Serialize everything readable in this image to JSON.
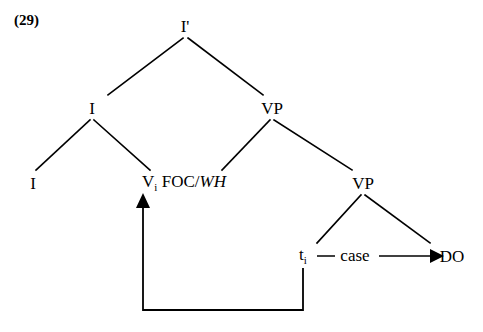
{
  "figure": {
    "example_number": "(29)",
    "ink_color": "#000000",
    "background_color": "#ffffff"
  },
  "tree": {
    "nodes": [
      {
        "id": "root",
        "label": "I'",
        "base": "I'",
        "subscript": "",
        "italic_part": "",
        "x": 185,
        "y": 26
      },
      {
        "id": "i-phrase",
        "label": "I",
        "base": "I",
        "subscript": "",
        "italic_part": "",
        "x": 92,
        "y": 108
      },
      {
        "id": "vp-upper",
        "label": "VP",
        "base": "VP",
        "subscript": "",
        "italic_part": "",
        "x": 272,
        "y": 108
      },
      {
        "id": "i-head",
        "label": "I",
        "base": "I",
        "subscript": "",
        "italic_part": "",
        "x": 33,
        "y": 183
      },
      {
        "id": "v-foc-wh",
        "label": "Vi FOC/WH",
        "base": "V",
        "subscript": "i",
        "italic_part": "WH",
        "middle": " FOC/",
        "x": 184,
        "y": 183
      },
      {
        "id": "vp-lower",
        "label": "VP",
        "base": "VP",
        "subscript": "",
        "italic_part": "",
        "x": 363,
        "y": 183
      },
      {
        "id": "trace",
        "label": "ti",
        "base": "t",
        "subscript": "i",
        "italic_part": "",
        "x": 303,
        "y": 256
      },
      {
        "id": "do",
        "label": "DO",
        "base": "DO",
        "subscript": "",
        "italic_part": "",
        "x": 452,
        "y": 256
      }
    ],
    "relation_labels": [
      {
        "id": "case-label",
        "text": "case",
        "x": 355,
        "y": 256
      }
    ],
    "branches": [
      {
        "from": "root",
        "to": "i-phrase",
        "x1": 183,
        "y1": 38,
        "x2": 108,
        "y2": 95
      },
      {
        "from": "root",
        "to": "vp-upper",
        "x1": 188,
        "y1": 38,
        "x2": 263,
        "y2": 95
      },
      {
        "from": "i-phrase",
        "to": "i-head",
        "x1": 90,
        "y1": 120,
        "x2": 36,
        "y2": 170
      },
      {
        "from": "i-phrase",
        "to": "v-foc-wh",
        "x1": 94,
        "y1": 120,
        "x2": 150,
        "y2": 170
      },
      {
        "from": "vp-upper",
        "to": "v-foc-wh",
        "x1": 270,
        "y1": 120,
        "x2": 222,
        "y2": 170
      },
      {
        "from": "vp-upper",
        "to": "vp-lower",
        "x1": 274,
        "y1": 120,
        "x2": 352,
        "y2": 170
      },
      {
        "from": "vp-lower",
        "to": "trace",
        "x1": 361,
        "y1": 195,
        "x2": 317,
        "y2": 243
      },
      {
        "from": "vp-lower",
        "to": "do",
        "x1": 365,
        "y1": 195,
        "x2": 430,
        "y2": 243
      }
    ],
    "case_relation": {
      "dash_x1": 316,
      "dash_x2": 334,
      "dash_y": 256,
      "arrow_x1": 379,
      "arrow_x2": 437,
      "arrow_y": 256
    },
    "movement_arrow": {
      "description": "head movement of V to I",
      "start_x": 303,
      "start_y": 268,
      "corner1_x": 303,
      "corner1_y": 310,
      "corner2_x": 143,
      "corner2_y": 310,
      "end_x": 143,
      "end_y": 196
    }
  }
}
